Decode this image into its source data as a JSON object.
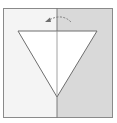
{
  "diagram": {
    "type": "origami-fold-step",
    "colors": {
      "background": "#ffffff",
      "paper_left": "#f4f4f4",
      "paper_right": "#d9d9d9",
      "outline": "#8a8a8a",
      "triangle_fill": "#ffffff",
      "triangle_stroke": "#6e6e6e",
      "arrow": "#7a7a7a"
    },
    "elements": {
      "square": {
        "x": 3,
        "y": 8,
        "width": 110,
        "height": 110
      },
      "fold_line_x": 57,
      "triangle": {
        "points": [
          [
            18,
            31
          ],
          [
            97,
            31
          ],
          [
            57,
            97
          ]
        ]
      },
      "arrow": {
        "from": [
          70,
          18
        ],
        "to": [
          46,
          21
        ],
        "direction": "fold-left"
      }
    }
  }
}
